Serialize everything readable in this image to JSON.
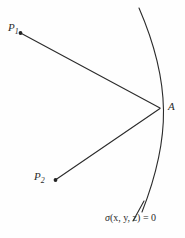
{
  "figure": {
    "background_color": "#fefefe",
    "stroke_color": "#2b2b2b",
    "width": 185,
    "height": 238,
    "labels": {
      "p1": "P",
      "p1_sub": "1",
      "p2": "P",
      "p2_sub": "2",
      "a": "A",
      "surface_symbol": "σ",
      "surface_args": "(x, y, z) = 0"
    },
    "points": [
      {
        "name": "P1",
        "x": 20,
        "y": 33
      },
      {
        "name": "P2",
        "x": 55,
        "y": 180
      },
      {
        "name": "A",
        "x": 161,
        "y": 108
      }
    ],
    "rays": [
      {
        "name": "ray-p1-a",
        "from": "P1",
        "to": "A"
      },
      {
        "name": "ray-p2-a",
        "from": "P2",
        "to": "A"
      }
    ],
    "curve": {
      "name": "implicit-surface-arc",
      "start": {
        "x": 139,
        "y": 8
      },
      "apex": {
        "x": 164,
        "y": 110
      },
      "end": {
        "x": 142,
        "y": 212
      }
    },
    "leader": {
      "name": "surface-label-leader",
      "from": {
        "x": 133,
        "y": 221
      },
      "to": {
        "x": 144,
        "y": 202
      }
    }
  }
}
